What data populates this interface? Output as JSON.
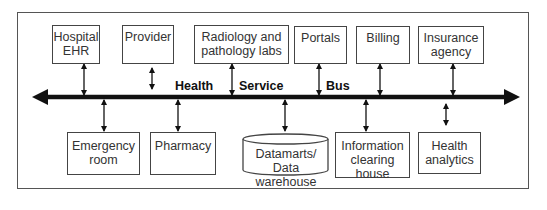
{
  "diagram": {
    "bus": {
      "labels": [
        "Health",
        "Service",
        "Bus"
      ],
      "direction": "bidirectional"
    },
    "top_nodes": [
      {
        "id": "hospital-ehr",
        "label_lines": [
          "Hospital",
          "EHR"
        ]
      },
      {
        "id": "provider",
        "label_lines": [
          "Provider"
        ]
      },
      {
        "id": "radiology-pathology-labs",
        "label_lines": [
          "Radiology and",
          "pathology labs"
        ]
      },
      {
        "id": "portals",
        "label_lines": [
          "Portals"
        ]
      },
      {
        "id": "billing",
        "label_lines": [
          "Billing"
        ]
      },
      {
        "id": "insurance-agency",
        "label_lines": [
          "Insurance",
          "agency"
        ]
      }
    ],
    "bottom_nodes": [
      {
        "id": "emergency-room",
        "label_lines": [
          "Emergency",
          "room"
        ]
      },
      {
        "id": "pharmacy",
        "label_lines": [
          "Pharmacy"
        ]
      },
      {
        "id": "datamarts-data-warehouse",
        "shape": "cylinder",
        "label_lines": [
          "Datamarts/",
          "Data warehouse"
        ]
      },
      {
        "id": "information-clearing-house",
        "label_lines": [
          "Information",
          "clearing",
          "house"
        ]
      },
      {
        "id": "health-analytics",
        "label_lines": [
          "Health",
          "analytics"
        ]
      }
    ],
    "colors": {
      "line": "#111111",
      "box_border": "#444444",
      "text": "#333333",
      "background": "#ffffff"
    }
  }
}
